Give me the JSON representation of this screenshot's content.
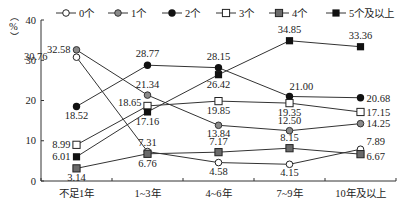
{
  "chart_data": {
    "type": "line",
    "title": "",
    "xlabel": "",
    "ylabel": "%",
    "ylim": [
      0,
      40
    ],
    "yticks": [
      0,
      10,
      20,
      30,
      40
    ],
    "categories": [
      "不足1年",
      "1~3年",
      "4~6年",
      "7~9年",
      "10年及以上"
    ],
    "legend_position": "top",
    "grid": false,
    "series": [
      {
        "name": "0个",
        "marker": "circle-open",
        "values": [
          30.76,
          7.31,
          4.58,
          4.15,
          7.89
        ]
      },
      {
        "name": "1个",
        "marker": "circle-gray",
        "values": [
          32.58,
          21.34,
          13.84,
          12.5,
          14.25
        ]
      },
      {
        "name": "2个",
        "marker": "circle-filled",
        "values": [
          18.52,
          28.77,
          28.15,
          21.0,
          20.68
        ]
      },
      {
        "name": "3个",
        "marker": "square-open",
        "values": [
          8.99,
          18.65,
          19.85,
          19.35,
          17.15
        ]
      },
      {
        "name": "4个",
        "marker": "square-gray",
        "values": [
          3.14,
          6.76,
          7.17,
          8.15,
          6.67
        ]
      },
      {
        "name": "5个及以上",
        "marker": "square-filled",
        "values": [
          6.01,
          17.16,
          26.42,
          34.85,
          33.36
        ]
      }
    ]
  },
  "labels": {
    "y_unit": "%"
  },
  "colors": {
    "line": "#333333",
    "gray_marker": "#8a8a8a",
    "dark_gray_marker": "#6a6a6a",
    "filled_marker": "#111111"
  }
}
